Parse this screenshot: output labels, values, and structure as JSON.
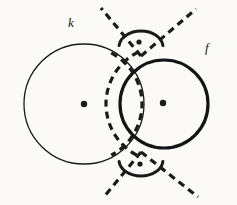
{
  "figure": {
    "canvas": {
      "width": 237,
      "height": 205
    },
    "background_color": "#fbfaf7",
    "ink_color": "#1a1a1a"
  },
  "labels": [
    {
      "name": "label-k",
      "text": "k",
      "x": 68,
      "y": 27,
      "describes": "left thin circle"
    },
    {
      "name": "label-f",
      "text": "f",
      "x": 205,
      "y": 52,
      "describes": "right thick circle"
    }
  ],
  "circles": [
    {
      "name": "circle-k",
      "label": "k",
      "cx": 84,
      "cy": 104,
      "r": 60,
      "stroke_width": 1.3,
      "style": "solid",
      "color": "#1a1a1a"
    },
    {
      "name": "circle-f",
      "label": "f",
      "cx": 164,
      "cy": 104,
      "r": 44,
      "stroke_width": 3.2,
      "style": "solid",
      "color": "#141414"
    }
  ],
  "dashed_arcs": [
    {
      "name": "dashed-arc-left",
      "cx": 84,
      "cy": 104,
      "r": 58,
      "note": "arc centred on left centre, passes through right centre",
      "stroke_width": 3.2,
      "dash": "7 5",
      "color": "#1a1a1a",
      "start_angle": -62,
      "end_angle": 62
    },
    {
      "name": "dashed-arc-right",
      "cx": 164,
      "cy": 104,
      "r": 58,
      "note": "arc centred on right centre, passes through left centre",
      "stroke_width": 3.2,
      "dash": "7 5",
      "color": "#1a1a1a",
      "start_angle": 118,
      "end_angle": 242
    }
  ],
  "dashed_rays": [
    {
      "name": "ray-top-left",
      "x1": 141,
      "y1": 56,
      "x2": 101,
      "y2": 8,
      "stroke_width": 3.2,
      "dash": "7 5"
    },
    {
      "name": "ray-top-right",
      "x1": 141,
      "y1": 56,
      "x2": 196,
      "y2": 9,
      "stroke_width": 3.2,
      "dash": "7 5"
    },
    {
      "name": "ray-bottom-left",
      "x1": 141,
      "y1": 152,
      "x2": 103,
      "y2": 198,
      "stroke_width": 3.2,
      "dash": "7 5"
    },
    {
      "name": "ray-bottom-right",
      "x1": 141,
      "y1": 152,
      "x2": 198,
      "y2": 197,
      "stroke_width": 3.2,
      "dash": "7 5"
    }
  ],
  "cap_arcs": [
    {
      "name": "cap-arc-top",
      "path_note": "small solid arc capping above top intersection",
      "cx": 141,
      "cy": 47,
      "rx": 22,
      "ry": 16,
      "stroke_width": 3.0,
      "start_angle": 185,
      "end_angle": 355
    },
    {
      "name": "cap-arc-bottom",
      "path_note": "small solid arc capping below bottom intersection",
      "cx": 141,
      "cy": 160,
      "rx": 22,
      "ry": 16,
      "stroke_width": 3.0,
      "start_angle": 5,
      "end_angle": 175
    }
  ],
  "points": [
    {
      "name": "point-center-k",
      "x": 84,
      "y": 104,
      "r": 3.2,
      "role": "centre of circle k"
    },
    {
      "name": "point-center-f",
      "x": 163,
      "y": 103,
      "r": 3.2,
      "role": "centre of circle f"
    },
    {
      "name": "point-top-marker",
      "x": 139,
      "y": 42,
      "r": 2.6,
      "role": "marked point above top intersection"
    },
    {
      "name": "point-bottom-marker",
      "x": 140,
      "y": 164,
      "r": 2.6,
      "role": "marked point below bottom intersection"
    }
  ]
}
